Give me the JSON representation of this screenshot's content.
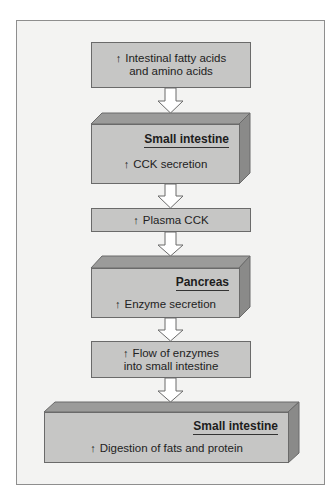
{
  "diagram": {
    "type": "flowchart",
    "direction": "top-to-bottom",
    "colors": {
      "background": "#ffffff",
      "frame_fill": "#f3f3f2",
      "frame_border": "#8e8e8e",
      "box_fill": "#c6c6c5",
      "box_top_face": "#9b9b9a",
      "box_side_face": "#8a8a89",
      "box_border": "#6a6a6a",
      "arrow_fill": "#ffffff",
      "arrow_stroke": "#6a6a6a",
      "text": "#222222"
    },
    "up_arrow_symbol": "↑",
    "nodes": [
      {
        "id": "n1",
        "style": "flat",
        "lines": [
          "Intestinal fatty acids",
          "and amino acids"
        ],
        "increase": true
      },
      {
        "id": "n2",
        "style": "3d",
        "organ": "Small intestine",
        "effect": "CCK secretion",
        "increase": true
      },
      {
        "id": "n3",
        "style": "flat",
        "lines": [
          "Plasma CCK"
        ],
        "increase": true
      },
      {
        "id": "n4",
        "style": "3d",
        "organ": "Pancreas",
        "effect": "Enzyme secretion",
        "increase": true
      },
      {
        "id": "n5",
        "style": "flat",
        "lines": [
          "Flow of enzymes",
          "into small intestine"
        ],
        "increase": true
      },
      {
        "id": "n6",
        "style": "3d-wide",
        "organ": "Small intestine",
        "effect": "Digestion of fats and protein",
        "increase": true
      }
    ],
    "edges": [
      {
        "from": "n1",
        "to": "n2"
      },
      {
        "from": "n2",
        "to": "n3"
      },
      {
        "from": "n3",
        "to": "n4"
      },
      {
        "from": "n4",
        "to": "n5"
      },
      {
        "from": "n5",
        "to": "n6"
      }
    ]
  }
}
